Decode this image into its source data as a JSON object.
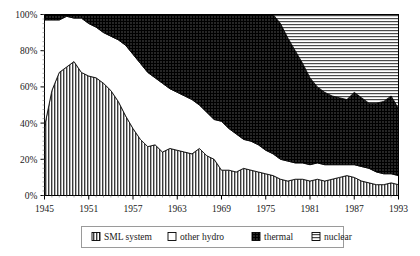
{
  "chart_data": {
    "type": "area",
    "stacked": true,
    "normalized_percent": true,
    "title": "",
    "subtitle": "",
    "xlabel": "",
    "ylabel": "",
    "xlim": [
      1945,
      1993
    ],
    "ylim": [
      0,
      100
    ],
    "grid": false,
    "legend_position": "bottom",
    "y_ticks": [
      "0%",
      "20%",
      "40%",
      "60%",
      "80%",
      "100%"
    ],
    "y_tick_values": [
      0,
      20,
      40,
      60,
      80,
      100
    ],
    "x_ticks": [
      "1945",
      "1951",
      "1957",
      "1963",
      "1969",
      "1975",
      "1981",
      "1987",
      "1993"
    ],
    "x_tick_values": [
      1945,
      1951,
      1957,
      1963,
      1969,
      1975,
      1981,
      1987,
      1993
    ],
    "x": [
      1945,
      1946,
      1947,
      1948,
      1949,
      1950,
      1951,
      1952,
      1953,
      1954,
      1955,
      1956,
      1957,
      1958,
      1959,
      1960,
      1961,
      1962,
      1963,
      1964,
      1965,
      1966,
      1967,
      1968,
      1969,
      1970,
      1971,
      1972,
      1973,
      1974,
      1975,
      1976,
      1977,
      1978,
      1979,
      1980,
      1981,
      1982,
      1983,
      1984,
      1985,
      1986,
      1987,
      1988,
      1989,
      1990,
      1991,
      1992,
      1993
    ],
    "series": [
      {
        "name": "SML system",
        "pattern": "vertical-hatch",
        "color": "#8a8a8a",
        "values": [
          38,
          58,
          68,
          71,
          74,
          68,
          66,
          65,
          62,
          58,
          52,
          44,
          37,
          31,
          27,
          28,
          24,
          26,
          25,
          24,
          23,
          26,
          22,
          20,
          14,
          14,
          13,
          15,
          14,
          13,
          12,
          11,
          9,
          8,
          9,
          9,
          8,
          9,
          8,
          9,
          10,
          11,
          10,
          8,
          7,
          6,
          6,
          7,
          6
        ]
      },
      {
        "name": "other hydro",
        "pattern": "solid-white",
        "color": "#ffffff",
        "values": [
          59,
          39,
          29,
          28,
          24,
          30,
          29,
          28,
          28,
          30,
          34,
          39,
          41,
          42,
          41,
          37,
          38,
          33,
          32,
          31,
          30,
          24,
          24,
          22,
          27,
          23,
          21,
          16,
          16,
          15,
          13,
          12,
          11,
          11,
          9,
          9,
          9,
          9,
          9,
          8,
          7,
          6,
          7,
          8,
          8,
          7,
          6,
          5,
          5
        ]
      },
      {
        "name": "thermal",
        "pattern": "dark-crosshatch",
        "color": "#2b2b2b",
        "values": [
          3,
          3,
          3,
          1,
          2,
          2,
          5,
          7,
          10,
          12,
          14,
          17,
          22,
          27,
          32,
          35,
          38,
          41,
          43,
          45,
          47,
          50,
          54,
          58,
          59,
          63,
          66,
          69,
          70,
          72,
          75,
          77,
          75,
          68,
          62,
          55,
          48,
          42,
          40,
          38,
          37,
          36,
          40,
          38,
          36,
          38,
          40,
          43,
          37
        ]
      },
      {
        "name": "nuclear",
        "pattern": "horizontal-hatch",
        "color": "#d9d9d9",
        "values": [
          0,
          0,
          0,
          0,
          0,
          0,
          0,
          0,
          0,
          0,
          0,
          0,
          0,
          0,
          0,
          0,
          0,
          0,
          0,
          0,
          0,
          0,
          0,
          0,
          0,
          0,
          0,
          0,
          0,
          0,
          0,
          0,
          5,
          13,
          20,
          27,
          35,
          40,
          43,
          45,
          46,
          47,
          43,
          46,
          49,
          49,
          48,
          45,
          52
        ]
      }
    ]
  },
  "legend": {
    "items": [
      {
        "label": "SML system",
        "pattern": "vertical-hatch"
      },
      {
        "label": "other hydro",
        "pattern": "solid-white"
      },
      {
        "label": "thermal",
        "pattern": "dark-crosshatch"
      },
      {
        "label": "nuclear",
        "pattern": "horizontal-hatch"
      }
    ]
  }
}
